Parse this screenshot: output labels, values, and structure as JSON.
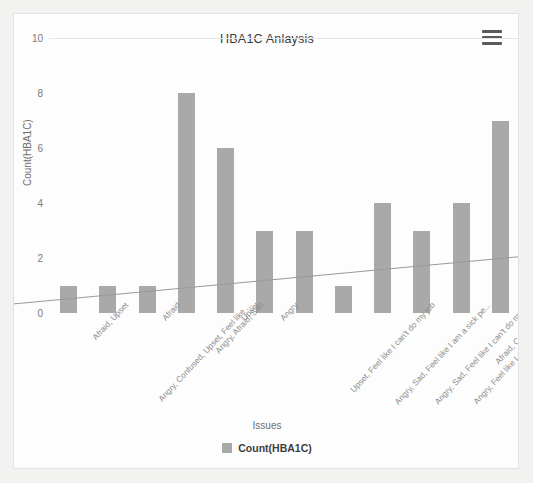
{
  "card": {
    "menu_icon": "hamburger-menu-icon"
  },
  "chart_data": {
    "type": "bar",
    "title": "HBA1C Anlaysis",
    "xlabel": "Issues",
    "ylabel": "Count(HBA1C)",
    "ylim": [
      0,
      10
    ],
    "yticks": [
      0,
      2,
      4,
      6,
      8,
      10
    ],
    "grid": false,
    "legend_position": "bottom",
    "legend": [
      "Count(HBA1C)"
    ],
    "series_color": "#a9a9a9",
    "categories": [
      "Afraid, Upset",
      "Angry, Confused, Upset, Feel like ...",
      "Afraid",
      "Angry, Afraid, Sad",
      "Upset",
      "Angry",
      "Upset, Feel like I can't do my job",
      "Angry, Sad, Feel like I am a sick pe...",
      "Angry, Sad, Feel like I can't do my j...",
      "Angry, Feel like I can't live the way ...",
      "Afraid, Confused, Sad",
      "Sad, Upset, Feel like I can't do my j..."
    ],
    "series": [
      {
        "name": "Count(HBA1C)",
        "values": [
          1,
          1,
          1,
          8,
          6,
          3,
          3,
          1,
          4,
          3,
          4,
          7
        ]
      }
    ],
    "trendline": {
      "type": "linear",
      "color": "#9a9a9a",
      "y_start": 0.45,
      "y_end": 2.05
    }
  }
}
